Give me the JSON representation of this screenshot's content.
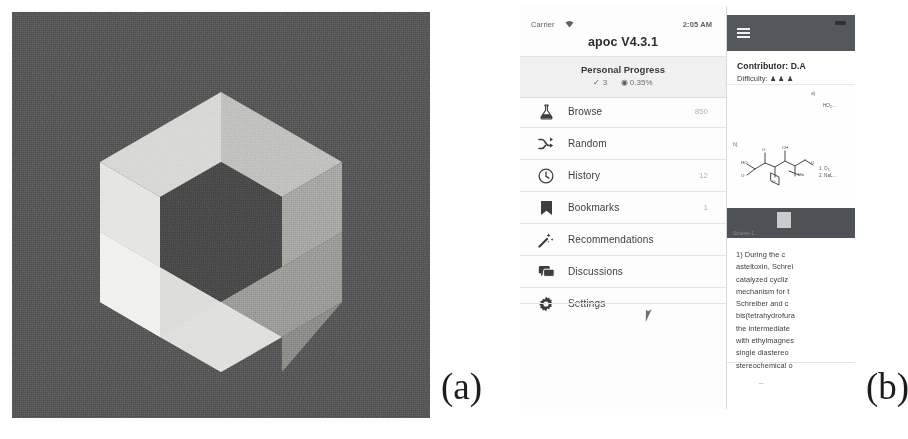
{
  "figure": {
    "panel_a_label": "(a)",
    "panel_b_label": "(b)",
    "panel_a_alt": "apoc hexagonal logo"
  },
  "logo": {
    "name": "hexagonal-ring-logo",
    "background_color": "#5a5a5a",
    "facet_colors": [
      "#e9e9e7",
      "#dcdcda",
      "#c9c9c6",
      "#b8b8b5",
      "#a7a7a4",
      "#9a9a97",
      "#8d8d8a"
    ],
    "inner_color": "#4c4c4c"
  },
  "phone": {
    "status_bar": {
      "carrier": "Carrier",
      "wifi_icon": "wifi-icon",
      "time": "2:05 AM"
    },
    "app_title": "apoc V4.3.1",
    "progress": {
      "title": "Personal Progress",
      "solved_icon": "check-icon",
      "solved_count": "3",
      "percent_icon": "globe-icon",
      "percent": "0.35%"
    },
    "menu": [
      {
        "icon": "flask-icon",
        "label": "Browse",
        "count": "850"
      },
      {
        "icon": "shuffle-icon",
        "label": "Random",
        "count": ""
      },
      {
        "icon": "clock-icon",
        "label": "History",
        "count": "12"
      },
      {
        "icon": "bookmark-icon",
        "label": "Bookmarks",
        "count": "1"
      },
      {
        "icon": "magic-wand-icon",
        "label": "Recommendations",
        "count": ""
      },
      {
        "icon": "discussions-icon",
        "label": "Discussions",
        "count": ""
      },
      {
        "icon": "gear-icon",
        "label": "Settings",
        "count": ""
      }
    ],
    "cursor_icon": "mouse-pointer-icon",
    "content": {
      "menu_button_icon": "hamburger-icon",
      "contributor": "Contributor: D.A",
      "difficulty_label": "Difficulty:",
      "difficulty_stars": "♟♟♟",
      "scheme": {
        "label_a": "a)",
        "label_b": "b)",
        "reagent_note": "HO₂…",
        "conditions": "1. O₃\n2. NaL…",
        "band_caption": "Scheme 1."
      },
      "body_lines": [
        "1) During the c",
        "asteltoxin, Schrei",
        "catalyzed cycliz",
        "mechanism for t",
        "Schreiber and c",
        "bis(tetrahydrofura",
        "the intermediate",
        "with ethylmagnes",
        "single diastereo",
        "stereochemical o"
      ],
      "footer_mark": "–"
    }
  }
}
